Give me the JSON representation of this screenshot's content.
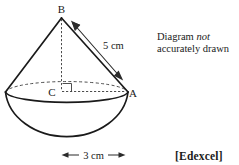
{
  "figure": {
    "points": {
      "apex_label": "B",
      "center_label": "C",
      "rim_label": "A"
    },
    "dimensions": {
      "slant_height": "5 cm",
      "base_radius": "3 cm"
    },
    "note": {
      "line1_prefix": "Diagram ",
      "line1_emphasis": "not",
      "line2": "accurately drawn"
    },
    "source": "[Edexcel]",
    "colors": {
      "ink": "#1a1a1a",
      "construction": "#3a3a3a",
      "background": "#ffffff"
    }
  }
}
